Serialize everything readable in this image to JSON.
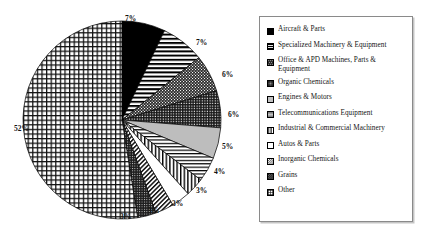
{
  "chart_data": {
    "type": "pie",
    "title": "",
    "legend_position": "right",
    "categories": [
      "Aircraft & Parts",
      "Specialized Machinery & Equipment",
      "Office & APD Machines, Parts & Equipment",
      "Organic Chemicals",
      "Engines & Motors",
      "Telecommunications Equipment",
      "Industrial & Commercial Machinery",
      "Autos & Parts",
      "Inorganic Chemicals",
      "Grains",
      "Other"
    ],
    "values": [
      7,
      7,
      6,
      6,
      5,
      4,
      3,
      3,
      3,
      3,
      52
    ],
    "value_labels": [
      "7%",
      "7%",
      "6%",
      "6%",
      "5%",
      "4%",
      "3%",
      "3%",
      "3%",
      "3%",
      "52%"
    ],
    "unit": "%",
    "start_angle_deg": 0,
    "direction": "clockwise"
  },
  "pie": {
    "labels": [
      {
        "text": "7%",
        "x": 125,
        "y": 14,
        "slice": "Aircraft & Parts"
      },
      {
        "text": "7%",
        "x": 196,
        "y": 38,
        "slice": "Specialized Machinery & Equipment"
      },
      {
        "text": "6%",
        "x": 222,
        "y": 70,
        "slice": "Office & APD Machines, Parts & Equipment"
      },
      {
        "text": "6%",
        "x": 228,
        "y": 110,
        "slice": "Organic Chemicals"
      },
      {
        "text": "5%",
        "x": 222,
        "y": 142,
        "slice": "Engines & Motors"
      },
      {
        "text": "4%",
        "x": 214,
        "y": 167,
        "slice": "Telecommunications Equipment"
      },
      {
        "text": "3%",
        "x": 196,
        "y": 186,
        "slice": "Industrial & Commercial Machinery"
      },
      {
        "text": "3%",
        "x": 172,
        "y": 199,
        "slice": "Autos & Parts"
      },
      {
        "text": "3%",
        "x": 148,
        "y": 206,
        "slice": "Inorganic Chemicals"
      },
      {
        "text": "3%",
        "x": 120,
        "y": 212,
        "slice": "Grains"
      },
      {
        "text": "52%",
        "x": 14,
        "y": 124,
        "slice": "Other"
      }
    ],
    "geometry": {
      "cx": 122,
      "cy": 120,
      "r": 99
    }
  },
  "legend": {
    "items": [
      {
        "label": "Aircraft & Parts",
        "pattern": "solid-black"
      },
      {
        "label": "Specialized Machinery & Equipment",
        "pattern": "horizontal-lines"
      },
      {
        "label": "Office & APD Machines, Parts & Equipment",
        "pattern": "dense-dark-dots"
      },
      {
        "label": "Organic Chemicals",
        "pattern": "dense-crosshatch"
      },
      {
        "label": "Engines & Motors",
        "pattern": "light-gray"
      },
      {
        "label": "Telecommunications Equipment",
        "pattern": "thin-horizontal-lines"
      },
      {
        "label": "Industrial & Commercial Machinery",
        "pattern": "vertical-lines"
      },
      {
        "label": "Autos & Parts",
        "pattern": "white-empty"
      },
      {
        "label": "Inorganic Chemicals",
        "pattern": "diagonal-hatch"
      },
      {
        "label": "Grains",
        "pattern": "dark-dense-hatch"
      },
      {
        "label": "Other",
        "pattern": "grid"
      }
    ]
  }
}
